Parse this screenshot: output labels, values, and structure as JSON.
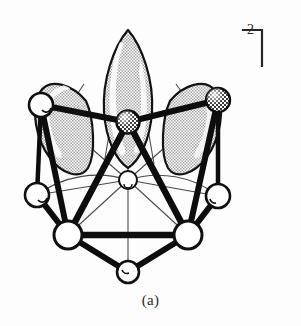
{
  "figure": {
    "caption": "(a)",
    "charge_label": "2−",
    "colors": {
      "outline": "#111111",
      "bond_bold": "#0d0d0d",
      "bond_thin": "#3a3a3a",
      "vertex_open_fill": "#ffffff",
      "vertex_shaded_fill": "#6e6e6e",
      "lobe_fill": "#d4d4d4",
      "lobe_highlight": "#fbfbfb",
      "background": "#fdfdfd"
    }
  },
  "structure": {
    "type": "cluster-polyhedron",
    "vertices": [
      {
        "id": "v-top-left",
        "label": "open-sphere",
        "cx": 41,
        "cy": 105,
        "r": 12,
        "style": "open"
      },
      {
        "id": "v-top-right",
        "label": "shaded-sphere",
        "cx": 218,
        "cy": 100,
        "r": 12,
        "style": "shaded"
      },
      {
        "id": "v-apex-center",
        "label": "shaded-sphere",
        "cx": 128,
        "cy": 122,
        "r": 11,
        "style": "shaded"
      },
      {
        "id": "v-mid-left",
        "label": "open-sphere",
        "cx": 37,
        "cy": 195,
        "r": 12,
        "style": "open"
      },
      {
        "id": "v-mid-right",
        "label": "open-sphere",
        "cx": 218,
        "cy": 196,
        "r": 12,
        "style": "open"
      },
      {
        "id": "v-center",
        "label": "open-sphere",
        "cx": 128,
        "cy": 180,
        "r": 9,
        "style": "open"
      },
      {
        "id": "v-lower-left",
        "label": "open-sphere",
        "cx": 68,
        "cy": 235,
        "r": 14,
        "style": "open"
      },
      {
        "id": "v-lower-right",
        "label": "open-sphere",
        "cx": 188,
        "cy": 235,
        "r": 14,
        "style": "open"
      },
      {
        "id": "v-bottom",
        "label": "open-sphere",
        "cx": 128,
        "cy": 272,
        "r": 11,
        "style": "open"
      }
    ],
    "bonds_bold": [
      {
        "from": "v-top-left",
        "to": "v-apex-center"
      },
      {
        "from": "v-apex-center",
        "to": "v-top-right"
      },
      {
        "from": "v-top-left",
        "to": "v-mid-left"
      },
      {
        "from": "v-top-right",
        "to": "v-mid-right"
      },
      {
        "from": "v-top-left",
        "to": "v-lower-left"
      },
      {
        "from": "v-top-right",
        "to": "v-lower-right"
      },
      {
        "from": "v-mid-left",
        "to": "v-lower-left"
      },
      {
        "from": "v-mid-right",
        "to": "v-lower-right"
      },
      {
        "from": "v-apex-center",
        "to": "v-lower-left"
      },
      {
        "from": "v-apex-center",
        "to": "v-lower-right"
      },
      {
        "from": "v-lower-left",
        "to": "v-lower-right"
      },
      {
        "from": "v-lower-left",
        "to": "v-bottom"
      },
      {
        "from": "v-lower-right",
        "to": "v-bottom"
      }
    ],
    "bonds_thin": [
      {
        "from": "v-center",
        "to": "v-apex-center"
      },
      {
        "from": "v-center",
        "to": "v-mid-left"
      },
      {
        "from": "v-center",
        "to": "v-mid-right"
      },
      {
        "from": "v-center",
        "to": "v-bottom"
      },
      {
        "from": "v-center",
        "to": "v-lower-left"
      },
      {
        "from": "v-center",
        "to": "v-lower-right"
      }
    ],
    "lobes": [
      {
        "id": "lobe-left",
        "label": "ligand-lobe",
        "tip_x": 86,
        "tip_y": 101,
        "angle": -38
      },
      {
        "id": "lobe-center",
        "label": "ligand-lobe",
        "tip_x": 128,
        "tip_y": 108,
        "angle": 0
      },
      {
        "id": "lobe-right",
        "label": "ligand-lobe",
        "tip_x": 170,
        "tip_y": 101,
        "angle": 38
      }
    ],
    "lobe_stems": [
      {
        "from_x": 82,
        "from_y": 86,
        "to_x": 66,
        "to_y": 116
      },
      {
        "from_x": 116,
        "from_y": 96,
        "to_x": 104,
        "to_y": 162
      },
      {
        "from_x": 140,
        "from_y": 96,
        "to_x": 152,
        "to_y": 162
      },
      {
        "from_x": 174,
        "from_y": 86,
        "to_x": 192,
        "to_y": 113
      }
    ]
  }
}
